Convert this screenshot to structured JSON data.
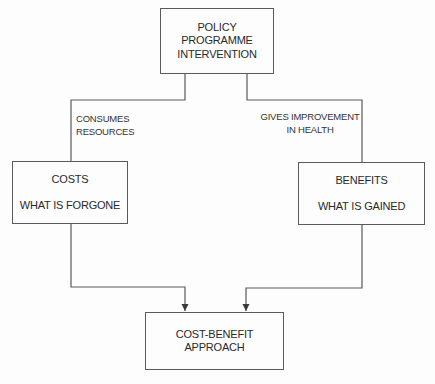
{
  "diagram": {
    "type": "flowchart",
    "colors": {
      "line": "#5a5a5a",
      "text": "#2a2a2a",
      "background": "#fdfdfd"
    },
    "nodes": {
      "top": {
        "line1": "POLICY",
        "line2": "PROGRAMME",
        "line3": "INTERVENTION"
      },
      "costs": {
        "title": "COSTS",
        "subtitle": "WHAT IS FORGONE"
      },
      "benefits": {
        "title": "BENEFITS",
        "subtitle": "WHAT IS GAINED"
      },
      "bottom": {
        "line1": "COST-BENEFIT",
        "line2": "APPROACH"
      }
    },
    "edges": {
      "left_label": "CONSUMES RESOURCES",
      "right_label_line1": "GIVES IMPROVEMENT",
      "right_label_line2": "IN HEALTH"
    }
  }
}
